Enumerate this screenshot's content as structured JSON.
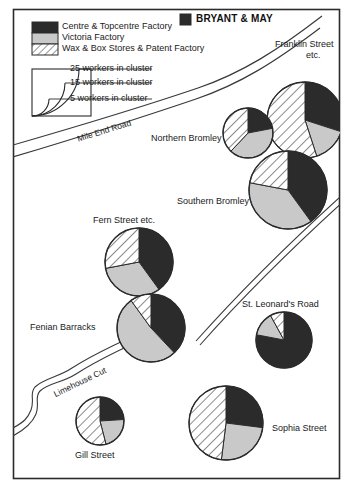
{
  "figure": {
    "kind": "thematic-map",
    "title": "BRYANT & MAY",
    "title_swatch": "centre-topcentre",
    "frame_color": "#2b2b2b",
    "background": "#ffffff"
  },
  "legend": {
    "categories": [
      {
        "key": "centre-topcentre",
        "label": "Centre & Topcentre Factory",
        "fill": "#2b2b2b",
        "pattern": "solid"
      },
      {
        "key": "victoria",
        "label": "Victoria Factory",
        "fill": "#c9c9c9",
        "pattern": "solid"
      },
      {
        "key": "wax-box-patent",
        "label": "Wax & Box Stores & Patent Factory",
        "fill": "#ffffff",
        "pattern": "diagonal-hatch"
      }
    ],
    "scale": {
      "title": "",
      "rings": [
        {
          "label": "25 workers in cluster",
          "workers": 25
        },
        {
          "label": "15 workers in cluster",
          "workers": 15
        },
        {
          "label": "5 workers in cluster",
          "workers": 5
        }
      ]
    }
  },
  "roads": [
    {
      "name": "Mile End Road",
      "type": "road"
    },
    {
      "name": "Limehouse Cut",
      "type": "canal"
    }
  ],
  "chart_data": {
    "type": "pie",
    "title": "BRYANT & MAY",
    "legend_position": "top-left",
    "categories": [
      "Centre & Topcentre Factory",
      "Victoria Factory",
      "Wax & Box Stores & Patent Factory"
    ],
    "colors": [
      "#2b2b2b",
      "#c9c9c9",
      "#ffffff"
    ],
    "series": [
      {
        "name": "Franklin Street etc.",
        "label": "Franklin Street\netc.",
        "workers": 25,
        "radius_px": 38,
        "cx": 305,
        "cy": 120,
        "values": [
          30,
          15,
          55
        ],
        "start_angle": 0
      },
      {
        "name": "Northern Bromley",
        "label": "Northern Bromley",
        "workers": 13,
        "radius_px": 25,
        "cx": 248,
        "cy": 133,
        "values": [
          22,
          40,
          38
        ],
        "start_angle": 0
      },
      {
        "name": "Southern Bromley",
        "label": "Southern Bromley",
        "workers": 25,
        "radius_px": 39,
        "cx": 288,
        "cy": 190,
        "values": [
          40,
          38,
          22
        ],
        "start_angle": 0
      },
      {
        "name": "Fern Street etc.",
        "label": "Fern Street etc.",
        "workers": 21,
        "radius_px": 34,
        "cx": 139,
        "cy": 262,
        "values": [
          40,
          32,
          28
        ],
        "start_angle": 0
      },
      {
        "name": "Fenian Barracks",
        "label": "Fenian Barracks",
        "workers": 21,
        "radius_px": 34,
        "cx": 151,
        "cy": 328,
        "values": [
          38,
          52,
          10
        ],
        "start_angle": 0
      },
      {
        "name": "St. Leonard's Road",
        "label": "St. Leonard's Road",
        "workers": 17,
        "radius_px": 28,
        "cx": 284,
        "cy": 340,
        "values": [
          78,
          14,
          8
        ],
        "start_angle": 0
      },
      {
        "name": "Sophia Street",
        "label": "Sophia Street",
        "workers": 23,
        "radius_px": 37,
        "cx": 226,
        "cy": 423,
        "values": [
          27,
          25,
          48
        ],
        "start_angle": 0
      },
      {
        "name": "Gill Street",
        "label": "Gill Street",
        "workers": 13,
        "radius_px": 24,
        "cx": 100,
        "cy": 421,
        "values": [
          24,
          22,
          54
        ],
        "start_angle": 0
      }
    ]
  },
  "labels": {
    "franklin": "Franklin Street",
    "franklin2": "etc.",
    "northern_bromley": "Northern Bromley",
    "southern_bromley": "Southern Bromley",
    "fern_street": "Fern Street etc.",
    "fenian_barracks": "Fenian Barracks",
    "st_leonards": "St. Leonard's Road",
    "sophia_street": "Sophia Street",
    "gill_street": "Gill Street",
    "mile_end_road": "Mile End Road",
    "limehouse_cut": "Limehouse Cut"
  }
}
